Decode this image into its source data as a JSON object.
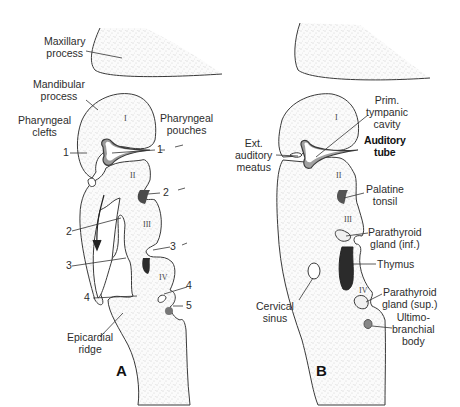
{
  "figure": {
    "panels": [
      {
        "id": "A",
        "panel_label": "A",
        "labels": {
          "maxillary_l1": "Maxillary",
          "maxillary_l2": "process",
          "mandibular_l1": "Mandibular",
          "mandibular_l2": "process",
          "clefts_l1": "Pharyngeal",
          "clefts_l2": "clefts",
          "pouches_l1": "Pharyngeal",
          "pouches_l2": "pouches",
          "epicardial_l1": "Epicardial",
          "epicardial_l2": "ridge"
        },
        "cleft_numbers": [
          "1",
          "2",
          "3",
          "4"
        ],
        "pouch_numbers": [
          "1",
          "2",
          "3",
          "4",
          "5"
        ],
        "arches": [
          "I",
          "II",
          "III",
          "IV"
        ]
      },
      {
        "id": "B",
        "panel_label": "B",
        "labels": {
          "prim_l1": "Prim.",
          "prim_l2": "tympanic",
          "prim_l3": "cavity",
          "auditory_tube_l1": "Auditory",
          "auditory_tube_l2": "tube",
          "ext_l1": "Ext.",
          "ext_l2": "auditory",
          "ext_l3": "meatus",
          "palatine_l1": "Palatine",
          "palatine_l2": "tonsil",
          "parainf_l1": "Parathyroid",
          "parainf_l2": "gland (inf.)",
          "thymus": "Thymus",
          "cervical_l1": "Cervical",
          "cervical_l2": "sinus",
          "parasup_l1": "Parathyroid",
          "parasup_l2": "gland (sup.)",
          "ultimo_l1": "Ultimo-",
          "ultimo_l2": "branchial",
          "ultimo_l3": "body"
        },
        "arches": [
          "I",
          "II",
          "III",
          "IV"
        ]
      }
    ],
    "colors": {
      "outline": "#3a3a3a",
      "stipple": "#bdbdbd",
      "dark_fill": "#2b2b2b",
      "mid_fill": "#6e6e6e",
      "light_fill": "#9a9a9a"
    }
  }
}
